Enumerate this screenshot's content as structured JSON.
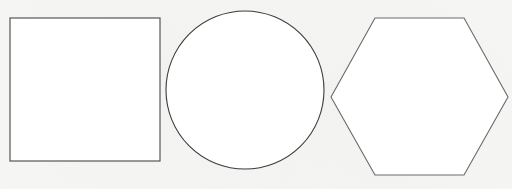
{
  "diagram": {
    "background_color": "#f6f6f5",
    "stroke_color": "#4a4a4a",
    "shapes": [
      {
        "type": "square",
        "label": "Square",
        "x": 10,
        "y": 18,
        "width": 150,
        "height": 143,
        "fill": "#ffffff",
        "stroke": "#555555",
        "stroke_width": 1.2
      },
      {
        "type": "circle",
        "label": "Circle",
        "cx": 245,
        "cy": 90,
        "r": 79,
        "fill": "#ffffff",
        "stroke": "#3c3c3c",
        "stroke_width": 1.1
      },
      {
        "type": "hexagon",
        "label": "Hexagon",
        "points": "375,18 464,18 508,97 464,175 375,175 331,97",
        "fill": "#ffffff",
        "stroke": "#6a6a6a",
        "stroke_width": 1.1
      }
    ]
  }
}
